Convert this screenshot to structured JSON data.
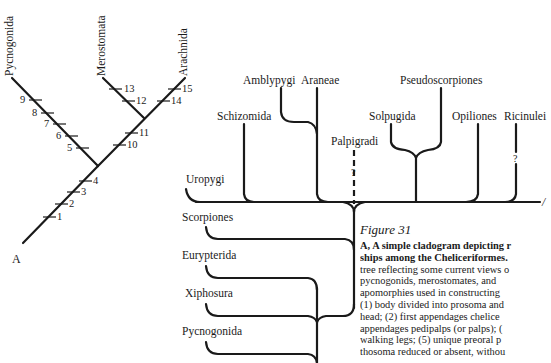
{
  "figure": {
    "title": "Figure 31",
    "caption_lines": [
      {
        "text": "A, A simple cladogram depicting r",
        "bold": true
      },
      {
        "text": "ships among the Cheliceriformes.",
        "bold": true
      },
      {
        "text": "tree reflecting some current views o",
        "bold": false
      },
      {
        "text": "pycnogonids, merostomates, and",
        "bold": false
      },
      {
        "text": "apomorphies used in constructing",
        "bold": false
      },
      {
        "text": "(1) body divided into prosoma and",
        "bold": false
      },
      {
        "text": "head; (2) first appendages chelice",
        "bold": false
      },
      {
        "text": "appendages pedipalps (or palps); (",
        "bold": false
      },
      {
        "text": "walking legs; (5) unique preoral p",
        "bold": false
      },
      {
        "text": "thosoma reduced or absent, withou",
        "bold": false
      }
    ]
  },
  "cladogram_a": {
    "panel_label": "A",
    "taxa": [
      "Pycnogonida",
      "Merostomata",
      "Arachnida"
    ],
    "characters": [
      "1",
      "2",
      "3",
      "4",
      "5",
      "6",
      "7",
      "8",
      "9",
      "10",
      "11",
      "12",
      "13",
      "14",
      "15"
    ]
  },
  "cladogram_b": {
    "panel_label_partial": "/",
    "upper_taxa": {
      "uropygi": "Uropygi",
      "schizomida": "Schizomida",
      "amblypygi": "Amblypygi",
      "araneae": "Araneae",
      "palpigradi": "Palpigradi",
      "solpugida": "Solpugida",
      "pseudoscorpiones": "Pseudoscorpiones",
      "opiliones": "Opiliones",
      "ricinulei": "Ricinulei"
    },
    "lower_taxa": {
      "scorpiones": "Scorpiones",
      "eurypterida": "Eurypterida",
      "xiphosura": "Xiphosura",
      "pycnogonida": "Pycnogonida"
    },
    "uncertain_mark": "?"
  }
}
